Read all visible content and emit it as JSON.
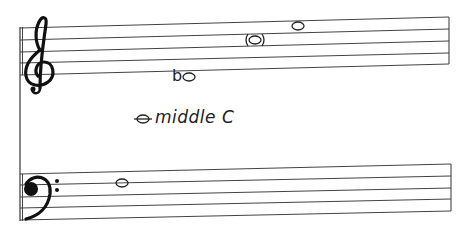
{
  "diagram": {
    "type": "grand-staff-note-diagram",
    "colors": {
      "ink": "#222222",
      "line": "#444444",
      "background": "#ffffff"
    },
    "treble_staff": {
      "clef": "treble-clef",
      "notes": [
        {
          "id": "b-flat",
          "accidental": "flat",
          "position": "below staff (ledger area)"
        },
        {
          "id": "parenthesized-note",
          "parenthesized": true,
          "position": "3rd space"
        },
        {
          "id": "high-note",
          "position": "4th space"
        }
      ]
    },
    "middle_c": {
      "label": "middle C",
      "has_ledger_line": true
    },
    "bass_staff": {
      "clef": "bass-clef",
      "notes": [
        {
          "id": "bass-note",
          "position": "4th space"
        }
      ]
    },
    "flat_symbol": "b"
  }
}
